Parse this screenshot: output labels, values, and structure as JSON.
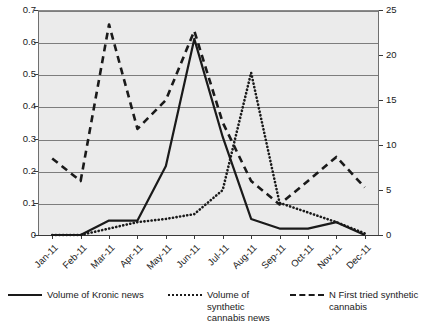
{
  "chart_data": {
    "type": "line",
    "title": "",
    "xlabel": "",
    "ylabel": "",
    "categories": [
      "Jan-11",
      "Feb-11",
      "Mar-11",
      "Apr-11",
      "May-11",
      "Jun-11",
      "Jul-11",
      "Aug-11",
      "Sep-11",
      "Oct-11",
      "Nov-11",
      "Dec-11"
    ],
    "axes": {
      "left": {
        "label": "",
        "ylim": [
          0,
          0.7
        ],
        "ticks": [
          "0",
          "0.1",
          "0.2",
          "0.3",
          "0.4",
          "0.5",
          "0.6",
          "0.7"
        ],
        "tickvalues": [
          0,
          0.1,
          0.2,
          0.3,
          0.4,
          0.5,
          0.6,
          0.7
        ]
      },
      "right": {
        "label": "",
        "ylim": [
          0,
          25
        ],
        "ticks": [
          "0",
          "5",
          "10",
          "15",
          "20",
          "25"
        ],
        "tickvalues": [
          0,
          5,
          10,
          15,
          20,
          25
        ]
      }
    },
    "grid": true,
    "legend_position": "bottom",
    "series": [
      {
        "name": "Volume of Kronic news",
        "style": "solid",
        "axis": "left",
        "values": [
          0,
          0,
          0.045,
          0.045,
          0.215,
          0.61,
          0.305,
          0.05,
          0.02,
          0.02,
          0.04,
          0.0
        ]
      },
      {
        "name": "Volume of synthetic cannabis news",
        "style": "dotted",
        "axis": "left",
        "values": [
          0,
          0,
          0.02,
          0.04,
          0.05,
          0.065,
          0.14,
          0.505,
          0.1,
          0.07,
          0.04,
          0.005
        ]
      },
      {
        "name": "N First tried synthetic cannabis",
        "style": "dashed",
        "axis": "right",
        "values": [
          8.5,
          6.0,
          23.4,
          11.8,
          15.0,
          22.7,
          12.5,
          6.0,
          3.4,
          6.0,
          8.7,
          5.3
        ],
        "values_left_scale": [
          0.238,
          0.168,
          0.655,
          0.33,
          0.42,
          0.635,
          0.35,
          0.168,
          0.095,
          0.168,
          0.243,
          0.148
        ]
      }
    ]
  },
  "legend": {
    "items": [
      {
        "label": "Volume of Kronic news",
        "style": "solid"
      },
      {
        "label": "Volume of synthetic\ncannabis news",
        "style": "dotted"
      },
      {
        "label": "N First tried synthetic\ncannabis",
        "style": "dashed"
      }
    ]
  },
  "colors": {
    "plot_background": "#ebebeb",
    "gridline": "#7d7d7d",
    "series_ink": "#1a1a1a",
    "axis": "#3a3a3a"
  }
}
